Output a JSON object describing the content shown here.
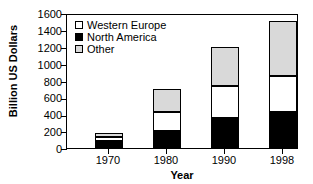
{
  "chart_data": {
    "type": "bar",
    "stacked": true,
    "title": "",
    "xlabel": "Year",
    "ylabel": "Billion US Dollars",
    "categories": [
      "1970",
      "1980",
      "1990",
      "1998"
    ],
    "series": [
      {
        "name": "North America",
        "color": "#000000",
        "values": [
          80,
          205,
          355,
          430
        ]
      },
      {
        "name": "Western Europe",
        "color": "#ffffff",
        "values": [
          45,
          220,
          380,
          425
        ]
      },
      {
        "name": "Other",
        "color": "#d9d9d9",
        "values": [
          55,
          275,
          465,
          645
        ]
      }
    ],
    "stack_order_bottom_to_top": [
      "North America",
      "Western Europe",
      "Other"
    ],
    "totals": [
      180,
      700,
      1200,
      1500
    ],
    "ylim": [
      0,
      1600
    ],
    "ytick_step": 200,
    "yticks": [
      "0",
      "200",
      "400",
      "600",
      "800",
      "1000",
      "1200",
      "1400",
      "1600"
    ],
    "grid": false,
    "legend_position": "top-left-inside",
    "legend_entries": [
      "Western Europe",
      "North America",
      "Other"
    ]
  }
}
